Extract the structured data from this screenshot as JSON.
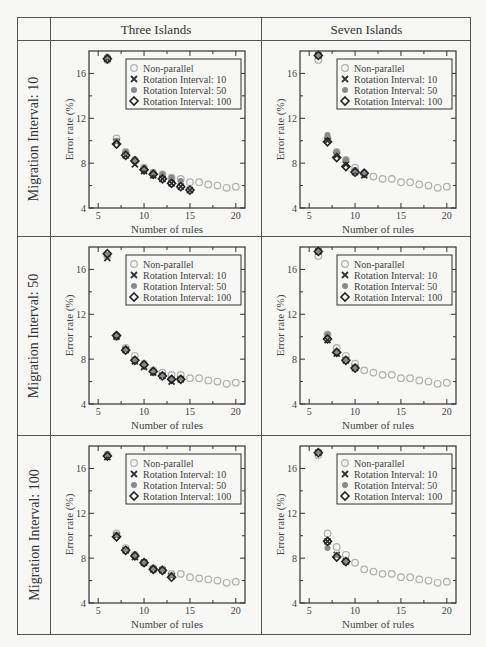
{
  "table": {
    "column_headers": [
      "Three Islands",
      "Seven Islands"
    ],
    "row_headers": [
      "Migration Interval: 10",
      "Migration Interval: 50",
      "Migration Interval: 100"
    ]
  },
  "axes": {
    "xlabel": "Number of rules",
    "ylabel": "Error rate (%)",
    "xlim": [
      4,
      21
    ],
    "ylim": [
      4,
      18
    ],
    "xticks": [
      5,
      10,
      15,
      20
    ],
    "yticks": [
      4,
      8,
      12,
      16
    ]
  },
  "legend": [
    {
      "label": "Non-parallel",
      "marker": "open-circle",
      "color": "#b0b0b0"
    },
    {
      "label": "Rotation Interval: 10",
      "marker": "x",
      "color": "#333333"
    },
    {
      "label": "Rotation Interval: 50",
      "marker": "filled-circle",
      "color": "#8a8a8a"
    },
    {
      "label": "Rotation Interval: 100",
      "marker": "open-diamond",
      "color": "#222222"
    }
  ],
  "chart_data": [
    {
      "type": "scatter",
      "title": "Three Islands / Migration Interval: 10",
      "xlabel": "Number of rules",
      "ylabel": "Error rate (%)",
      "xlim": [
        4,
        21
      ],
      "ylim": [
        4,
        18
      ],
      "legend_position": "upper right",
      "series": [
        {
          "name": "Non-parallel",
          "x": [
            6,
            7,
            8,
            9,
            10,
            11,
            12,
            13,
            14,
            15,
            16,
            17,
            18,
            19,
            20
          ],
          "values": [
            17.2,
            10.2,
            9.0,
            8.3,
            7.6,
            7.1,
            7.0,
            6.7,
            6.6,
            6.3,
            6.3,
            6.1,
            6.0,
            5.8,
            5.9
          ]
        },
        {
          "name": "Rotation Interval: 10",
          "x": [
            6,
            7,
            8,
            9,
            10,
            11,
            12,
            13,
            14,
            15
          ],
          "values": [
            17.3,
            9.9,
            8.7,
            7.9,
            7.3,
            6.9,
            6.6,
            6.2,
            5.9,
            5.6
          ]
        },
        {
          "name": "Rotation Interval: 50",
          "x": [
            6,
            7,
            8,
            9,
            10,
            11,
            12,
            13,
            14
          ],
          "values": [
            17.5,
            10.0,
            9.0,
            8.3,
            7.6,
            7.2,
            7.0,
            6.7,
            6.4
          ]
        },
        {
          "name": "Rotation Interval: 100",
          "x": [
            6,
            7,
            8,
            9,
            10,
            11,
            12,
            13,
            14,
            15
          ],
          "values": [
            17.3,
            9.7,
            8.7,
            8.2,
            7.4,
            7.0,
            6.6,
            6.2,
            5.9,
            5.6
          ]
        }
      ]
    },
    {
      "type": "scatter",
      "title": "Seven Islands / Migration Interval: 10",
      "xlabel": "Number of rules",
      "ylabel": "Error rate (%)",
      "xlim": [
        4,
        21
      ],
      "ylim": [
        4,
        18
      ],
      "legend_position": "upper right",
      "series": [
        {
          "name": "Non-parallel",
          "x": [
            6,
            7,
            8,
            9,
            10,
            11,
            12,
            13,
            14,
            15,
            16,
            17,
            18,
            19,
            20
          ],
          "values": [
            17.2,
            10.2,
            9.0,
            8.3,
            7.6,
            7.0,
            6.8,
            6.6,
            6.6,
            6.3,
            6.3,
            6.1,
            6.0,
            5.8,
            5.9
          ]
        },
        {
          "name": "Rotation Interval: 10",
          "x": [
            6,
            7,
            8,
            9,
            10,
            11
          ],
          "values": [
            17.6,
            10.0,
            8.7,
            7.9,
            7.2,
            6.9
          ]
        },
        {
          "name": "Rotation Interval: 50",
          "x": [
            6,
            7,
            8,
            9,
            10,
            11
          ],
          "values": [
            17.6,
            10.5,
            9.0,
            8.3,
            7.4,
            7.2
          ]
        },
        {
          "name": "Rotation Interval: 100",
          "x": [
            6,
            7,
            8,
            9,
            10,
            11
          ],
          "values": [
            17.6,
            9.9,
            8.5,
            7.7,
            7.2,
            7.1
          ]
        }
      ]
    },
    {
      "type": "scatter",
      "title": "Three Islands / Migration Interval: 50",
      "xlabel": "Number of rules",
      "ylabel": "Error rate (%)",
      "xlim": [
        4,
        21
      ],
      "ylim": [
        4,
        18
      ],
      "legend_position": "upper right",
      "series": [
        {
          "name": "Non-parallel",
          "x": [
            6,
            7,
            8,
            9,
            10,
            11,
            12,
            13,
            14,
            15,
            16,
            17,
            18,
            19,
            20
          ],
          "values": [
            17.2,
            10.0,
            9.0,
            8.3,
            7.6,
            7.0,
            6.8,
            6.6,
            6.6,
            6.3,
            6.3,
            6.1,
            6.0,
            5.8,
            5.9
          ]
        },
        {
          "name": "Rotation Interval: 10",
          "x": [
            6,
            7,
            8,
            9,
            10,
            11,
            12,
            13,
            14
          ],
          "values": [
            17.0,
            10.0,
            8.8,
            7.8,
            7.3,
            6.8,
            6.5,
            6.0,
            6.2
          ]
        },
        {
          "name": "Rotation Interval: 50",
          "x": [
            6,
            7,
            8,
            9,
            10,
            11,
            12,
            13,
            14
          ],
          "values": [
            17.3,
            10.2,
            8.9,
            8.0,
            7.6,
            7.0,
            6.6,
            6.3,
            6.3
          ]
        },
        {
          "name": "Rotation Interval: 100",
          "x": [
            6,
            7,
            8,
            9,
            10,
            11,
            12,
            13,
            14
          ],
          "values": [
            17.4,
            10.1,
            8.8,
            7.9,
            7.5,
            6.9,
            6.5,
            6.2,
            6.2
          ]
        }
      ]
    },
    {
      "type": "scatter",
      "title": "Seven Islands / Migration Interval: 50",
      "xlabel": "Number of rules",
      "ylabel": "Error rate (%)",
      "xlim": [
        4,
        21
      ],
      "ylim": [
        4,
        18
      ],
      "legend_position": "upper right",
      "series": [
        {
          "name": "Non-parallel",
          "x": [
            6,
            7,
            8,
            9,
            10,
            11,
            12,
            13,
            14,
            15,
            16,
            17,
            18,
            19,
            20
          ],
          "values": [
            17.2,
            10.2,
            9.0,
            8.3,
            7.6,
            7.0,
            6.8,
            6.6,
            6.6,
            6.3,
            6.3,
            6.1,
            6.0,
            5.8,
            5.9
          ]
        },
        {
          "name": "Rotation Interval: 10",
          "x": [
            6,
            7,
            8,
            9,
            10
          ],
          "values": [
            17.6,
            9.7,
            8.5,
            7.9,
            7.2
          ]
        },
        {
          "name": "Rotation Interval: 50",
          "x": [
            6,
            7,
            8,
            9,
            10
          ],
          "values": [
            17.6,
            10.2,
            8.7,
            8.0,
            7.3
          ]
        },
        {
          "name": "Rotation Interval: 100",
          "x": [
            6,
            7,
            8,
            9,
            10
          ],
          "values": [
            17.6,
            9.8,
            8.6,
            7.9,
            7.2
          ]
        }
      ]
    },
    {
      "type": "scatter",
      "title": "Three Islands / Migration Interval: 100",
      "xlabel": "Number of rules",
      "ylabel": "Error rate (%)",
      "xlim": [
        4,
        21
      ],
      "ylim": [
        4,
        18
      ],
      "legend_position": "upper right",
      "series": [
        {
          "name": "Non-parallel",
          "x": [
            6,
            7,
            8,
            9,
            10,
            11,
            12,
            13,
            14,
            15,
            16,
            17,
            18,
            19,
            20
          ],
          "values": [
            17.2,
            10.2,
            8.9,
            8.3,
            7.6,
            7.1,
            7.0,
            6.6,
            6.6,
            6.3,
            6.2,
            6.1,
            6.0,
            5.8,
            5.9
          ]
        },
        {
          "name": "Rotation Interval: 10",
          "x": [
            6,
            7,
            8,
            9,
            10,
            11,
            12,
            13
          ],
          "values": [
            17.0,
            10.0,
            8.7,
            8.1,
            7.6,
            7.0,
            6.9,
            6.4
          ]
        },
        {
          "name": "Rotation Interval: 50",
          "x": [
            6,
            7,
            8,
            9,
            10,
            11,
            12,
            13
          ],
          "values": [
            17.3,
            10.1,
            8.8,
            8.3,
            7.6,
            7.1,
            7.0,
            6.5
          ]
        },
        {
          "name": "Rotation Interval: 100",
          "x": [
            6,
            7,
            8,
            9,
            10,
            11,
            12,
            13
          ],
          "values": [
            17.1,
            9.9,
            8.7,
            8.2,
            7.6,
            7.0,
            6.9,
            6.3
          ]
        }
      ]
    },
    {
      "type": "scatter",
      "title": "Seven Islands / Migration Interval: 100",
      "xlabel": "Number of rules",
      "ylabel": "Error rate (%)",
      "xlim": [
        4,
        21
      ],
      "ylim": [
        4,
        18
      ],
      "legend_position": "upper right",
      "series": [
        {
          "name": "Non-parallel",
          "x": [
            6,
            7,
            8,
            9,
            10,
            11,
            12,
            13,
            14,
            15,
            16,
            17,
            18,
            19,
            20
          ],
          "values": [
            17.2,
            10.2,
            9.0,
            8.3,
            7.6,
            7.0,
            6.8,
            6.6,
            6.6,
            6.3,
            6.3,
            6.1,
            6.0,
            5.8,
            5.9
          ]
        },
        {
          "name": "Rotation Interval: 10",
          "x": [
            6,
            7,
            8,
            9
          ],
          "values": [
            17.4,
            9.5,
            8.3,
            7.7
          ]
        },
        {
          "name": "Rotation Interval: 50",
          "x": [
            6,
            7,
            8,
            9
          ],
          "values": [
            17.5,
            8.9,
            8.3,
            7.7
          ]
        },
        {
          "name": "Rotation Interval: 100",
          "x": [
            6,
            7,
            8,
            9
          ],
          "values": [
            17.4,
            9.5,
            8.1,
            7.7
          ]
        }
      ]
    }
  ]
}
